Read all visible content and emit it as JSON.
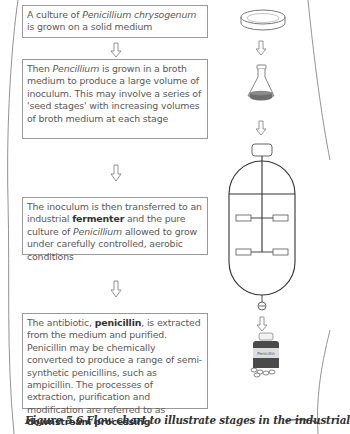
{
  "figure": {
    "caption": "Figure 5.6 Flow chart to illustrate stages in the industrial",
    "steps": [
      {
        "parts": [
          {
            "t": "A culture of "
          },
          {
            "t": "Penicillium chrysogenum",
            "style": "italic"
          },
          {
            "t": " is grown on a solid medium"
          }
        ],
        "illustration": "petri-dish"
      },
      {
        "parts": [
          {
            "t": "Then "
          },
          {
            "t": "Pencillium",
            "style": "italic"
          },
          {
            "t": " is grown in a broth medium to produce a large volume of inoculum. This may involve a series of 'seed stages' with increasing volumes of broth medium at each stage"
          }
        ],
        "illustration": "conical-flask"
      },
      {
        "parts": [
          {
            "t": "The inoculum is then transferred to an industrial "
          },
          {
            "t": "fermenter",
            "style": "bold"
          },
          {
            "t": " and the pure culture of "
          },
          {
            "t": "Penicillium",
            "style": "italic"
          },
          {
            "t": " allowed to grow under carefully controlled, aerobic conditions"
          }
        ],
        "illustration": "fermenter"
      },
      {
        "parts": [
          {
            "t": "The antibiotic, "
          },
          {
            "t": "penicillin",
            "style": "bold"
          },
          {
            "t": ", is extracted from the medium and purified. Penicillin may be chemically converted to produce a range of semi-synthetic penicillins, such as ampicillin. The processes of extraction, purification and modification are referred to as "
          },
          {
            "t": "downstream processing",
            "style": "bold"
          }
        ],
        "illustration": "penicillin-bottle"
      }
    ],
    "bottle_label": "Penicillin",
    "colors": {
      "box_border": "#999999",
      "text": "#5a5a5a",
      "broth": "#6e6e6e",
      "line": "#333333"
    }
  }
}
